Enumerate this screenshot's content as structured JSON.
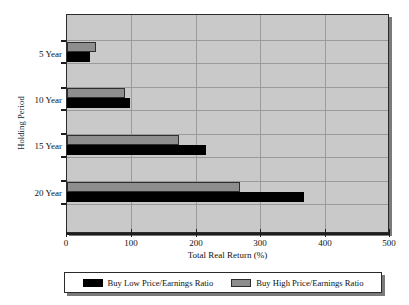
{
  "chart_data": {
    "type": "bar",
    "orientation": "horizontal",
    "title": "",
    "xlabel": "Total Real Return (%)",
    "ylabel": "Holding Period",
    "categories": [
      "5 Year",
      "10 Year",
      "15 Year",
      "20 Year"
    ],
    "series": [
      {
        "name": "Buy Low Price/Earnings Ratio",
        "color": "#000000",
        "values": [
          36,
          98,
          217,
          371
        ]
      },
      {
        "name": "Buy High Price/Earnings Ratio",
        "color": "#8e8e8e",
        "values": [
          45,
          90,
          175,
          271
        ]
      }
    ],
    "xlim": [
      0,
      500
    ],
    "xticks": [
      0,
      100,
      200,
      300,
      400,
      500
    ],
    "xtick_labels": [
      "0",
      "100",
      "200",
      "300",
      "400",
      "500"
    ],
    "grid": true,
    "grid_axis": "both",
    "legend_position": "bottom",
    "plot_background": "#c9c9c9",
    "figure_background": "#ffffff"
  }
}
